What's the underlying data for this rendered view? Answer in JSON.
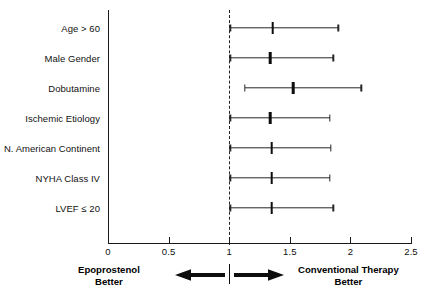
{
  "chart_data": {
    "type": "forest",
    "title": "",
    "xlabel": "",
    "ylabel": "",
    "xlim": [
      0,
      2.5
    ],
    "x_ticks": [
      0,
      0.5,
      1,
      1.5,
      2,
      2.5
    ],
    "x_tick_labels": [
      "0",
      "0.5",
      "1",
      "1.5",
      "2",
      "2.5"
    ],
    "reference_line": 1,
    "grid": false,
    "legend": "none",
    "effect_measure": "Hazard Ratio",
    "categories": [
      "Age > 60",
      "Male Gender",
      "Dobutamine",
      "Ischemic Etiology",
      "N. American Continent",
      "NYHA Class IV",
      "LVEF ≤ 20"
    ],
    "rows": [
      {
        "label": "Age > 60",
        "estimate": 1.36,
        "ci_low": 1.01,
        "ci_high": 1.9
      },
      {
        "label": "Male Gender",
        "estimate": 1.34,
        "ci_low": 1.01,
        "ci_high": 1.86
      },
      {
        "label": "Dobutamine",
        "estimate": 1.53,
        "ci_low": 1.13,
        "ci_high": 2.09
      },
      {
        "label": "Ischemic Etiology",
        "estimate": 1.34,
        "ci_low": 1.01,
        "ci_high": 1.83
      },
      {
        "label": "N. American Continent",
        "estimate": 1.35,
        "ci_low": 1.01,
        "ci_high": 1.84
      },
      {
        "label": "NYHA Class IV",
        "estimate": 1.35,
        "ci_low": 1.01,
        "ci_high": 1.83
      },
      {
        "label": "LVEF ≤ 20",
        "estimate": 1.35,
        "ci_low": 1.01,
        "ci_high": 1.86
      }
    ],
    "annotations": {
      "left_side_line1": "Epoprostenol",
      "left_side_line2": "Better",
      "right_side_line1": "Conventional Therapy",
      "right_side_line2": "Better"
    }
  }
}
